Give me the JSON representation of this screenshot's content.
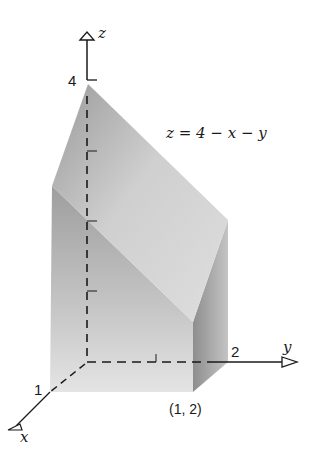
{
  "figure": {
    "type": "3d-solid-diagram",
    "equation_label": "z = 4 − x − y",
    "axes": {
      "x": {
        "label": "x",
        "tick_label": "1"
      },
      "y": {
        "label": "y",
        "tick_label": "2"
      },
      "z": {
        "label": "z",
        "tick_label": "4"
      }
    },
    "corner_label": "(1, 2)"
  },
  "colors": {
    "top_face": "#c9c9c9",
    "front_face": "#a8a8a8",
    "right_face": "#b5b5b5",
    "axis": "#1a1a1a",
    "background": "#ffffff"
  }
}
